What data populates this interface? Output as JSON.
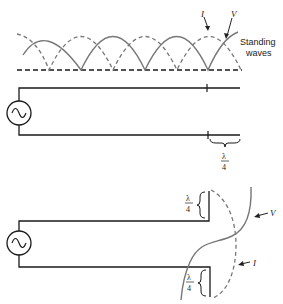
{
  "diagram": {
    "top_section": {
      "label_line1": "Standing",
      "label_line2": "waves",
      "current_label": "I",
      "voltage_label": "V"
    },
    "middle_section": {
      "stub_label_num": "λ",
      "stub_label_den": "4"
    },
    "bottom_section": {
      "top_stub_num": "λ",
      "top_stub_den": "4",
      "bottom_stub_num": "λ",
      "bottom_stub_den": "4",
      "voltage_label": "V",
      "current_label": "I"
    },
    "colors": {
      "wire": "#1a1a1a",
      "wave": "#777777"
    }
  }
}
